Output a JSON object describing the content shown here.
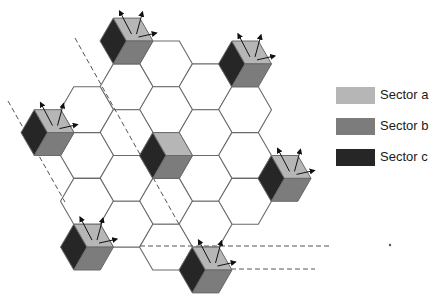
{
  "diagram": {
    "hex_radius": 26.5,
    "grid": {
      "center_x": 166,
      "center_y": 155.5,
      "col_spacing": 39.5,
      "half_row": 22.9
    },
    "colors": {
      "cell_stroke": "#6a6a6a",
      "sector_a": "#b6b6b6",
      "sector_b": "#7c7c7c",
      "sector_c": "#262626",
      "arrow": "#111111",
      "dashed_line": "#555555"
    },
    "plain_cells": [
      [
        0,
        -4
      ],
      [
        -1,
        -3
      ],
      [
        1,
        -3
      ],
      [
        -2,
        -2
      ],
      [
        0,
        -2
      ],
      [
        2,
        -2
      ],
      [
        -1,
        -1
      ],
      [
        1,
        -1
      ],
      [
        -2,
        0
      ],
      [
        2,
        0
      ],
      [
        -1,
        1
      ],
      [
        1,
        1
      ],
      [
        -2,
        2
      ],
      [
        0,
        2
      ],
      [
        2,
        2
      ],
      [
        -1,
        3
      ],
      [
        1,
        3
      ],
      [
        0,
        4
      ]
    ],
    "sector_cells": [
      {
        "name": "top-left-site",
        "pos": [
          -1,
          -5
        ]
      },
      {
        "name": "top-right-site",
        "pos": [
          2,
          -4
        ]
      },
      {
        "name": "left-site",
        "pos": [
          -3,
          -1
        ]
      },
      {
        "name": "center-site",
        "pos": [
          0,
          0
        ],
        "no_arrows": true
      },
      {
        "name": "right-site",
        "pos": [
          3,
          1
        ]
      },
      {
        "name": "bottom-left-site",
        "pos": [
          -2,
          4
        ]
      },
      {
        "name": "bottom-site",
        "pos": [
          1,
          5
        ]
      }
    ],
    "dashed_lines": [
      {
        "x1": 75,
        "y1": 38,
        "x2": 180,
        "y2": 226
      },
      {
        "x1": 8,
        "y1": 101,
        "x2": 65,
        "y2": 202
      },
      {
        "x1": 140,
        "y1": 246,
        "x2": 330,
        "y2": 246
      },
      {
        "x1": 231,
        "y1": 269,
        "x2": 315,
        "y2": 269
      }
    ],
    "stray_dot": {
      "x": 390,
      "y": 245
    }
  },
  "legend": {
    "items": [
      {
        "label": "Sector a",
        "color": "#b6b6b6"
      },
      {
        "label": "Sector b",
        "color": "#7c7c7c"
      },
      {
        "label": "Sector c",
        "color": "#262626"
      }
    ]
  }
}
